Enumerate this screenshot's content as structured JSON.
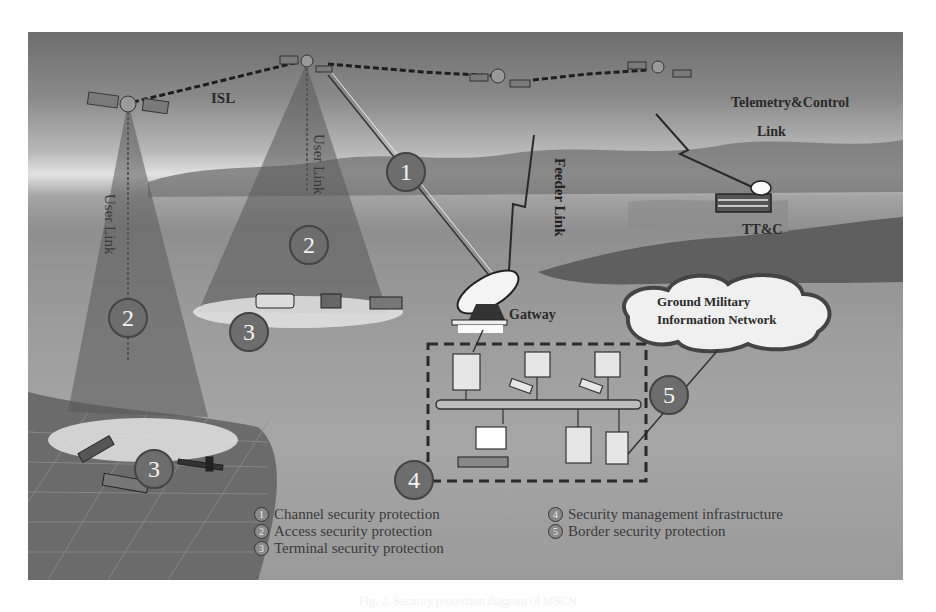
{
  "diagram": {
    "labels": {
      "isl": "ISL",
      "user_link_left": "User Link",
      "user_link_mid": "User Link",
      "feeder_link": "Feeder Link",
      "telemetry_line1": "Telemetry&Control",
      "telemetry_line2": "Link",
      "ttc": "TT&C",
      "gateway": "Gatway",
      "network_line1": "Ground Military",
      "network_line2": "Information Network"
    },
    "badges": [
      "1",
      "2",
      "2",
      "3",
      "3",
      "4",
      "5"
    ],
    "legend": [
      {
        "num": "1",
        "text": "Channel security protection"
      },
      {
        "num": "2",
        "text": "Access security protection"
      },
      {
        "num": "3",
        "text": "Terminal security protection"
      },
      {
        "num": "4",
        "text": "Security management infrastructure"
      },
      {
        "num": "5",
        "text": "Border security protection"
      }
    ],
    "colors": {
      "beam": "#6a6a6a",
      "badge_fill": "#6d6d6d",
      "link_line": "#333333",
      "dashed_box": "#333333"
    }
  },
  "caption": "Fig. 2. Security protection diagram of MSCN"
}
